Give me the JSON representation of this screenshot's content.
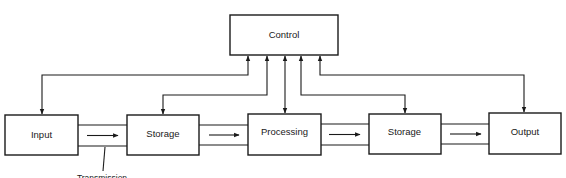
{
  "diagram": {
    "type": "block-diagram",
    "nodes": {
      "control": {
        "label": "Control"
      },
      "input": {
        "label": "Input"
      },
      "storage_1": {
        "label": "Storage"
      },
      "processing": {
        "label": "Processing"
      },
      "storage_2": {
        "label": "Storage"
      },
      "output": {
        "label": "Output"
      }
    },
    "annotations": {
      "transmission": {
        "label": "Transmission"
      }
    },
    "edges": [
      {
        "from": "input",
        "to": "storage_1",
        "kind": "transmission-channel"
      },
      {
        "from": "storage_1",
        "to": "processing",
        "kind": "transmission-channel"
      },
      {
        "from": "processing",
        "to": "storage_2",
        "kind": "transmission-channel"
      },
      {
        "from": "storage_2",
        "to": "output",
        "kind": "transmission-channel"
      },
      {
        "from": "control",
        "to": "input",
        "kind": "bidirectional-control"
      },
      {
        "from": "control",
        "to": "storage_1",
        "kind": "bidirectional-control"
      },
      {
        "from": "control",
        "to": "processing",
        "kind": "bidirectional-control"
      },
      {
        "from": "control",
        "to": "storage_2",
        "kind": "bidirectional-control"
      },
      {
        "from": "control",
        "to": "output",
        "kind": "bidirectional-control"
      }
    ],
    "colors": {
      "stroke": "#1a1a1a",
      "background": "#ffffff"
    }
  }
}
